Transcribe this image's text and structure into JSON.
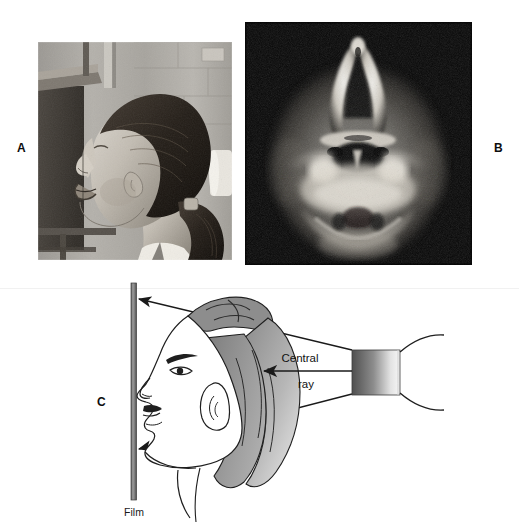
{
  "figure": {
    "kind": "radiographic-technique-figure",
    "background_color": "#ffffff",
    "width": 519,
    "height": 529
  },
  "panels": [
    {
      "id": "A",
      "label": "A",
      "type": "photograph",
      "subject": "patient-positioned-for-submentovertex-projection",
      "description_visible_text": "",
      "tone": "black-and-white"
    },
    {
      "id": "B",
      "label": "B",
      "type": "radiograph",
      "subject": "submentovertex-skull-radiograph",
      "background_color": "#050505",
      "tone": "black-and-white"
    },
    {
      "id": "C",
      "label": "C",
      "type": "line-diagram",
      "subject": "beam-geometry-film-and-tube-head"
    }
  ],
  "diagram": {
    "labels": {
      "central_ray_line1": "Central",
      "central_ray_line2": "ray",
      "film": "Film"
    },
    "colors": {
      "film_plate": "#8a8a8a",
      "film_plate_edge": "#4a4a4a",
      "hair_shade_dark": "#8c8c8c",
      "hair_shade_light": "#d8d8d8",
      "tube_dark": "#5c5c5c",
      "tube_light": "#f2f2f2",
      "outline": "#1a1a1a"
    }
  }
}
